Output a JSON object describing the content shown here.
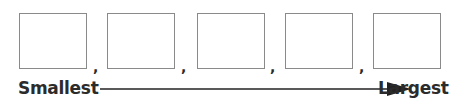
{
  "diagram": {
    "boxes": [
      {
        "id": 1,
        "value": ""
      },
      {
        "id": 2,
        "value": ""
      },
      {
        "id": 3,
        "value": ""
      },
      {
        "id": 4,
        "value": ""
      },
      {
        "id": 5,
        "value": ""
      }
    ],
    "separator": ",",
    "start_label": "Smallest",
    "end_label": "Largest",
    "colors": {
      "box_border": "#8a8a8a",
      "text": "#2b2b2b",
      "arrow": "#222222"
    }
  }
}
